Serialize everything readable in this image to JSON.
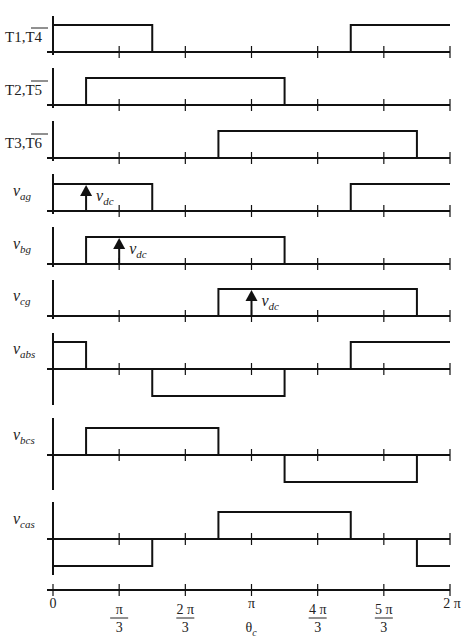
{
  "chart_data": {
    "type": "line",
    "title": "",
    "xlabel": "θc",
    "x_ticks": [
      "0",
      "π/3",
      "2π/3",
      "π",
      "4π/3",
      "5π/3",
      "2π"
    ],
    "x_range": [
      0,
      6.2832
    ],
    "step_style": "square-wave",
    "annotations": [
      {
        "panel": "v_ag",
        "text": "v_dc",
        "at_deg": 30
      },
      {
        "panel": "v_bg",
        "text": "v_dc",
        "at_deg": 60
      },
      {
        "panel": "v_cg",
        "text": "v_dc",
        "at_deg": 180
      }
    ],
    "series": [
      {
        "name": "T1,T4̄",
        "label_main": "T1,",
        "label_over": "T4",
        "type": "switch",
        "segments_deg": [
          [
            0,
            90,
            1
          ],
          [
            90,
            270,
            0
          ],
          [
            270,
            360,
            1
          ]
        ]
      },
      {
        "name": "T2,T5̄",
        "label_main": "T2,",
        "label_over": "T5",
        "type": "switch",
        "segments_deg": [
          [
            0,
            30,
            0
          ],
          [
            30,
            210,
            1
          ],
          [
            210,
            360,
            0
          ]
        ]
      },
      {
        "name": "T3,T6̄",
        "label_main": "T3,",
        "label_over": "T6",
        "type": "switch",
        "segments_deg": [
          [
            0,
            150,
            0
          ],
          [
            150,
            330,
            1
          ],
          [
            330,
            360,
            0
          ]
        ]
      },
      {
        "name": "v_ag",
        "sym": "v",
        "sub": "ag",
        "type": "unipolar",
        "segments_deg": [
          [
            0,
            90,
            1
          ],
          [
            90,
            270,
            0
          ],
          [
            270,
            360,
            1
          ]
        ]
      },
      {
        "name": "v_bg",
        "sym": "v",
        "sub": "bg",
        "type": "unipolar",
        "segments_deg": [
          [
            0,
            30,
            0
          ],
          [
            30,
            210,
            1
          ],
          [
            210,
            360,
            0
          ]
        ]
      },
      {
        "name": "v_cg",
        "sym": "v",
        "sub": "cg",
        "type": "unipolar",
        "segments_deg": [
          [
            0,
            150,
            0
          ],
          [
            150,
            330,
            1
          ],
          [
            330,
            360,
            0
          ]
        ]
      },
      {
        "name": "v_abs",
        "sym": "v",
        "sub": "abs",
        "type": "bipolar",
        "segments_deg": [
          [
            0,
            30,
            1
          ],
          [
            30,
            90,
            0
          ],
          [
            90,
            210,
            -1
          ],
          [
            210,
            270,
            0
          ],
          [
            270,
            360,
            1
          ]
        ]
      },
      {
        "name": "v_bcs",
        "sym": "v",
        "sub": "bcs",
        "type": "bipolar",
        "segments_deg": [
          [
            0,
            30,
            0
          ],
          [
            30,
            150,
            1
          ],
          [
            150,
            210,
            0
          ],
          [
            210,
            330,
            -1
          ],
          [
            330,
            360,
            0
          ]
        ]
      },
      {
        "name": "v_cas",
        "sym": "v",
        "sub": "cas",
        "type": "bipolar",
        "segments_deg": [
          [
            0,
            90,
            -1
          ],
          [
            90,
            150,
            0
          ],
          [
            150,
            270,
            1
          ],
          [
            270,
            330,
            0
          ],
          [
            330,
            360,
            -1
          ]
        ]
      }
    ]
  },
  "labels": {
    "t1_main": "T1,",
    "t1_over": "T4",
    "t2_main": "T2,",
    "t2_over": "T5",
    "t3_main": "T3,",
    "t3_over": "T6",
    "vag": "ag",
    "vbg": "bg",
    "vcg": "cg",
    "vabs": "abs",
    "vbcs": "bcs",
    "vcas": "cas",
    "v": "v",
    "vdc_sub": "dc",
    "xlabel_main": "θ",
    "xlabel_sub": "c"
  }
}
